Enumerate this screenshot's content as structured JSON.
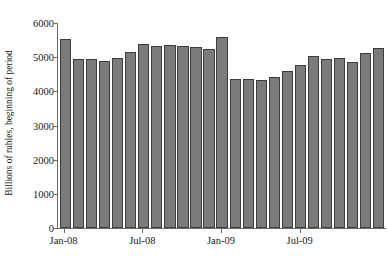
{
  "chart_data": {
    "type": "bar",
    "title": "",
    "subtitle": "",
    "xlabel": "",
    "ylabel": "Billions of rubles, beginning of period",
    "ylim": [
      0,
      6000
    ],
    "ytick_values": [
      0,
      1000,
      2000,
      3000,
      4000,
      5000,
      6000
    ],
    "ytick_labels": [
      "0",
      "1000",
      "2000",
      "3000",
      "4000",
      "5000",
      "6000"
    ],
    "grid": false,
    "legend": null,
    "legend_position": "none",
    "bar_color": "#7b7b7b",
    "bar_edge_color": "#3d3d3d",
    "axis_color": "#6b6b6b",
    "categories": [
      "Jan-08",
      "Feb-08",
      "Mar-08",
      "Apr-08",
      "May-08",
      "Jun-08",
      "Jul-08",
      "Aug-08",
      "Sep-08",
      "Oct-08",
      "Nov-08",
      "Dec-08",
      "Jan-09",
      "Feb-09",
      "Mar-09",
      "Apr-09",
      "May-09",
      "Jun-09",
      "Jul-09",
      "Aug-09",
      "Sep-09",
      "Oct-09",
      "Nov-09",
      "Dec-09",
      "Jan-10"
    ],
    "values": [
      5520,
      4940,
      4950,
      4880,
      4980,
      5150,
      5400,
      5330,
      5350,
      5320,
      5290,
      5250,
      5590,
      4360,
      4370,
      4340,
      4420,
      4600,
      4780,
      5030,
      4950,
      4970,
      4870,
      5120,
      5280
    ],
    "xtick_labels": [
      "Jan-08",
      "Jul-08",
      "Jan-09",
      "Jul-09"
    ],
    "xtick_indices": [
      0,
      6,
      12,
      18
    ]
  }
}
